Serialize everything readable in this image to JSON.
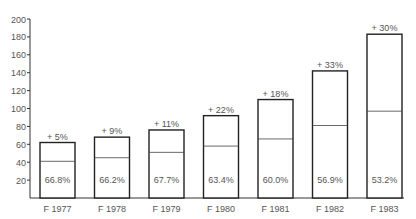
{
  "chart_data": {
    "type": "bar",
    "title": "",
    "xlabel": "",
    "ylabel": "",
    "ylim": [
      0,
      200
    ],
    "yticks": [
      20,
      40,
      60,
      80,
      100,
      120,
      140,
      160,
      180,
      200
    ],
    "categories": [
      "F 1977",
      "F 1978",
      "F 1979",
      "F 1980",
      "F 1981",
      "F 1982",
      "F 1983"
    ],
    "series": [
      {
        "name": "Total",
        "values": [
          62,
          68,
          76,
          92,
          110,
          142,
          183
        ]
      },
      {
        "name": "Inner portion",
        "values": [
          41,
          45,
          51,
          58,
          66,
          81,
          97
        ]
      }
    ],
    "growth_labels": [
      "+ 5%",
      "+ 9%",
      "+ 11%",
      "+ 22%",
      "+ 18%",
      "+ 33%",
      "+ 30%"
    ],
    "share_labels": [
      "66.8%",
      "66.2%",
      "67.7%",
      "63.4%",
      "60.0%",
      "56.9%",
      "53.2%"
    ],
    "grid": false,
    "legend": "none"
  }
}
